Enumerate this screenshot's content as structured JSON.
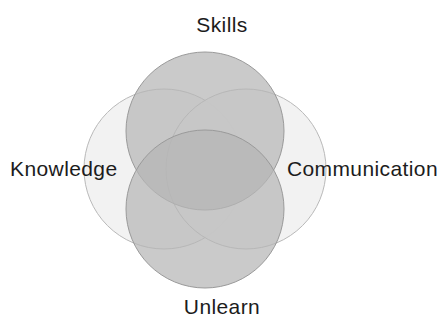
{
  "figure": {
    "background_color": "#ffffff",
    "width": 444,
    "height": 329
  },
  "labels": {
    "top": "Skills",
    "bottom": "Unlearn",
    "left": "Knowledge",
    "right": "Communication",
    "text_color": "#1c1c1c"
  },
  "chart_data": {
    "type": "venn",
    "title": "",
    "sets": [
      {
        "name": "Skills",
        "position": "top",
        "fill": "#b5b5b5",
        "stroke": "#9a9a9a",
        "cx": 205,
        "cy": 131,
        "r": 79
      },
      {
        "name": "Knowledge",
        "position": "left",
        "fill": "#f1f1f1",
        "stroke": "#b9b9b9",
        "cx": 164,
        "cy": 169,
        "r": 80
      },
      {
        "name": "Communication",
        "position": "right",
        "fill": "#f1f1f1",
        "stroke": "#b9b9b9",
        "cx": 246,
        "cy": 169,
        "r": 80
      },
      {
        "name": "Unlearn",
        "position": "bottom",
        "fill": "#b5b5b5",
        "stroke": "#9a9a9a",
        "cx": 205,
        "cy": 209,
        "r": 79
      }
    ],
    "intersections": [
      {
        "sets": [
          "Skills",
          "Unlearn"
        ],
        "fill": "#a0a0a0"
      },
      {
        "sets": [
          "Knowledge",
          "Communication"
        ],
        "fill": "#a8a8a8"
      },
      {
        "sets": [
          "Skills",
          "Unlearn",
          "Knowledge",
          "Communication"
        ],
        "fill": "#8b8b8b"
      }
    ],
    "legend": "none",
    "grid": false
  }
}
